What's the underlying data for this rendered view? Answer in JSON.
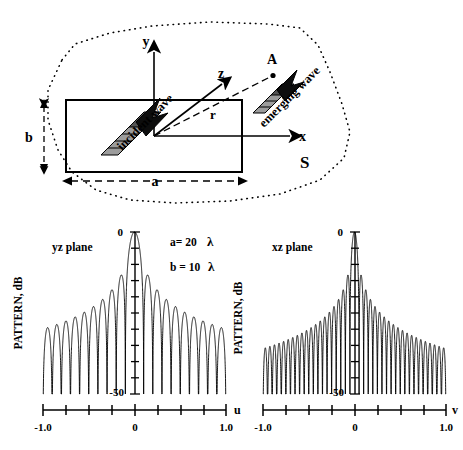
{
  "figure": {
    "diagram": {
      "name": "aperture-antenna-geometry",
      "axis_labels": {
        "x": "x",
        "y": "y",
        "z": "z"
      },
      "point_label": "A",
      "range_label": "r",
      "surface_label": "S",
      "aperture_width_label": "a",
      "aperture_height_label": "b",
      "incident_wave_label": "incident wave",
      "emerging_wave_label": "emerging wave"
    },
    "parameters": {
      "a_text": "a= 20",
      "a_unit": "λ",
      "b_text": "b = 10",
      "b_unit": "λ"
    },
    "colors": {
      "line": "#000000",
      "arrow_dark": "#1a1a1a",
      "arrow_light": "#9a9a9a",
      "dotted": "#000000"
    }
  },
  "chart_data": [
    {
      "type": "line",
      "name": "yz-plane-pattern",
      "title": "yz plane",
      "xlabel": "u",
      "ylabel": "PATTERN, dB",
      "xlim": [
        -1.0,
        1.0
      ],
      "ylim": [
        -50,
        0
      ],
      "xticks": [
        -1.0,
        -0.75,
        -0.5,
        -0.25,
        0,
        0.25,
        0.5,
        0.75,
        1.0
      ],
      "xticklabels": [
        "-1.0",
        "",
        "",
        "",
        "0",
        "",
        "",
        "",
        "1.0"
      ],
      "yticks": [
        0,
        -5,
        -10,
        -15,
        -20,
        -25,
        -30,
        -35,
        -40,
        -45,
        -50
      ],
      "yticklabels": [
        "0",
        "",
        "",
        "",
        "",
        "",
        "",
        "",
        "",
        "",
        "-50"
      ],
      "grid": false,
      "legend": null,
      "aperture_lambda": 10,
      "annotations": [
        "a= 20  λ",
        "b = 10  λ"
      ],
      "description": "sinc-squared (dB) array/aperture pattern, |sin(Nπu)/(Nπu)| for N=10 wavelengths, main beam at u=0 reaching 0 dB, ~20 visible sidelobes over u in [-1,1], envelope decaying toward -30 dB at edges, nulls clipped at -50 dB",
      "x": [
        -1.0,
        -0.95,
        -0.9,
        -0.85,
        -0.8,
        -0.75,
        -0.7,
        -0.65,
        -0.6,
        -0.55,
        -0.5,
        -0.45,
        -0.4,
        -0.35,
        -0.3,
        -0.25,
        -0.2,
        -0.15,
        -0.1,
        -0.05,
        0.0,
        0.05,
        0.1,
        0.15,
        0.2,
        0.25,
        0.3,
        0.35,
        0.4,
        0.45,
        0.5,
        0.55,
        0.6,
        0.65,
        0.7,
        0.75,
        0.8,
        0.85,
        0.9,
        0.95,
        1.0
      ],
      "y": [
        -50,
        -30.1,
        -50,
        -29.6,
        -50,
        -29.0,
        -50,
        -28.3,
        -50,
        -27.5,
        -50,
        -26.6,
        -50,
        -25.5,
        -50,
        -24.2,
        -50,
        -22.5,
        -50,
        -19.9,
        0,
        -19.9,
        -50,
        -22.5,
        -50,
        -24.2,
        -50,
        -25.5,
        -50,
        -26.6,
        -50,
        -27.5,
        -50,
        -28.3,
        -50,
        -29.0,
        -50,
        -29.6,
        -50,
        -30.1,
        -50
      ]
    },
    {
      "type": "line",
      "name": "xz-plane-pattern",
      "title": "xz plane",
      "xlabel": "v",
      "ylabel": "PATTERN, dB",
      "xlim": [
        -1.0,
        1.0
      ],
      "ylim": [
        -50,
        0
      ],
      "xticks": [
        -1.0,
        -0.75,
        -0.5,
        -0.25,
        0,
        0.25,
        0.5,
        0.75,
        1.0
      ],
      "xticklabels": [
        "-1.0",
        "",
        "",
        "",
        "0",
        "",
        "",
        "",
        "1.0"
      ],
      "yticks": [
        0,
        -5,
        -10,
        -15,
        -20,
        -25,
        -30,
        -35,
        -40,
        -45,
        -50
      ],
      "yticklabels": [
        "0",
        "",
        "",
        "",
        "",
        "",
        "",
        "",
        "",
        "",
        "-50"
      ],
      "grid": false,
      "legend": null,
      "aperture_lambda": 20,
      "annotations": [],
      "description": "sinc-squared (dB) aperture pattern for N=20 wavelengths, narrower main beam at v=0 reaching 0 dB, ~40 visible sidelobes over v in [-1,1], envelope decaying toward -33 dB at edges, nulls clipped at -50 dB",
      "x": [
        -1.0,
        -0.975,
        -0.95,
        -0.925,
        -0.9,
        -0.875,
        -0.85,
        -0.825,
        -0.8,
        -0.775,
        -0.75,
        -0.725,
        -0.7,
        -0.675,
        -0.65,
        -0.625,
        -0.6,
        -0.575,
        -0.55,
        -0.525,
        -0.5,
        -0.475,
        -0.45,
        -0.425,
        -0.4,
        -0.375,
        -0.35,
        -0.325,
        -0.3,
        -0.275,
        -0.25,
        -0.225,
        -0.2,
        -0.175,
        -0.15,
        -0.125,
        -0.1,
        -0.075,
        -0.05,
        -0.025,
        0.0,
        0.025,
        0.05,
        0.075,
        0.1,
        0.125,
        0.15,
        0.175,
        0.2,
        0.225,
        0.25,
        0.275,
        0.3,
        0.325,
        0.35,
        0.375,
        0.4,
        0.425,
        0.45,
        0.475,
        0.5,
        0.525,
        0.55,
        0.575,
        0.6,
        0.625,
        0.65,
        0.675,
        0.7,
        0.725,
        0.75,
        0.775,
        0.8,
        0.825,
        0.85,
        0.875,
        0.9,
        0.925,
        0.95,
        0.975,
        1.0
      ],
      "y": [
        -50,
        -33.1,
        -50,
        -32.9,
        -50,
        -32.6,
        -50,
        -32.3,
        -50,
        -31.9,
        -50,
        -31.5,
        -50,
        -31.1,
        -50,
        -30.6,
        -50,
        -30.1,
        -50,
        -29.5,
        -50,
        -28.9,
        -50,
        -28.2,
        -50,
        -27.4,
        -50,
        -26.6,
        -50,
        -25.6,
        -50,
        -24.5,
        -50,
        -23.2,
        -50,
        -21.6,
        -50,
        -19.6,
        -50,
        -13.3,
        0,
        -13.3,
        -50,
        -19.6,
        -50,
        -21.6,
        -50,
        -23.2,
        -50,
        -24.5,
        -50,
        -25.6,
        -50,
        -26.6,
        -50,
        -27.4,
        -50,
        -28.2,
        -50,
        -28.9,
        -50,
        -29.5,
        -50,
        -30.1,
        -50,
        -30.6,
        -50,
        -31.1,
        -50,
        -31.5,
        -50,
        -31.9,
        -50,
        -32.3,
        -50,
        -32.6,
        -50,
        -32.9,
        -50,
        -33.1,
        -50
      ]
    }
  ]
}
